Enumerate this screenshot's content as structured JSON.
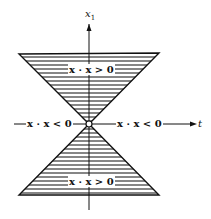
{
  "diagram": {
    "axis_vertical_label": "x",
    "axis_vertical_sub": "1",
    "axis_horizontal_label": "t",
    "regions": {
      "top": "x · x > 0",
      "bottom": "x · x > 0",
      "left": "x · x < 0",
      "right": "x · x < 0"
    },
    "colors": {
      "ink": "#111111",
      "background": "#ffffff"
    }
  }
}
